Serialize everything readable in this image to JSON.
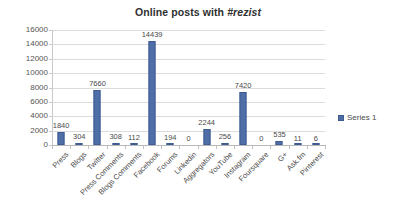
{
  "chart_data": {
    "type": "bar",
    "title": "Online posts with #rezist",
    "title_plain": "Online posts with ",
    "title_emphasis": "#rezist",
    "xlabel": "",
    "ylabel": "",
    "ylim": [
      0,
      16000
    ],
    "ytick_values": [
      0,
      2000,
      4000,
      6000,
      8000,
      10000,
      12000,
      14000,
      16000
    ],
    "ytick_labels": [
      "0",
      "2000",
      "4000",
      "6000",
      "8000",
      "10000",
      "12000",
      "14000",
      "16000"
    ],
    "grid": true,
    "legend_position": "right",
    "categories": [
      "Press",
      "Blogs",
      "Twitter",
      "Press Comments",
      "Blogs Comments",
      "Facebook",
      "Forums",
      "Linkedin",
      "Aggregators",
      "YouTube",
      "Instagram",
      "Foursquare",
      "G+",
      "Ask.fm",
      "Pinterest"
    ],
    "series": [
      {
        "name": "Series 1",
        "color": "#4f6ea8",
        "values": [
          1840,
          304,
          7660,
          308,
          112,
          14439,
          194,
          0,
          2244,
          256,
          7420,
          0,
          535,
          11,
          6
        ],
        "value_labels": [
          "1840",
          "304",
          "7660",
          "308",
          "112",
          "14439",
          "194",
          "0",
          "2244",
          "256",
          "7420",
          "0",
          "535",
          "11",
          "6"
        ]
      }
    ]
  },
  "legend": {
    "entries": [
      {
        "label": "Series 1",
        "color": "#4f6ea8"
      }
    ]
  },
  "colors": {
    "bar_fill": "#4f6ea8",
    "bar_stroke": "#3f5c91",
    "gridline": "#dcdcdc",
    "axis": "#b8b8b8",
    "text": "#4a4a4a",
    "title": "#2f2f2f",
    "background": "#ffffff"
  }
}
